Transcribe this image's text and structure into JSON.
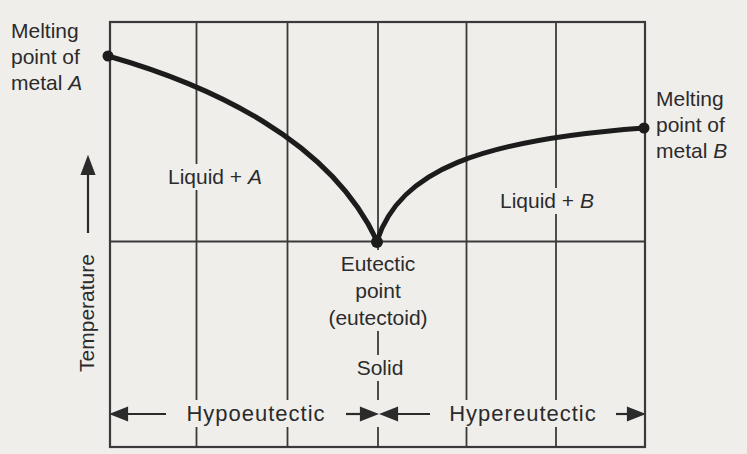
{
  "figure": {
    "kind": "binary eutectic phase diagram (temperature vs. composition, schematic, no numeric scales)",
    "background_color": "#f0eeeb",
    "line_color": "#1c1c1c",
    "grid_color": "#3a3a3a"
  },
  "axis": {
    "y_label": "Temperature",
    "y_arrow": "up"
  },
  "labels": {
    "melting_point_a": {
      "line1": "Melting",
      "line2": "point of",
      "line3": "metal",
      "metal": "A"
    },
    "melting_point_b": {
      "line1": "Melting",
      "line2": "point of",
      "line3": "metal",
      "metal": "B"
    },
    "region_liquid_a": {
      "prefix": "Liquid +",
      "metal": "A"
    },
    "region_liquid_b": {
      "prefix": "Liquid +",
      "metal": "B"
    },
    "eutectic": {
      "line1": "Eutectic",
      "line2": "point",
      "line3": "(eutectoid)"
    },
    "solid": "Solid",
    "hypoeutectic": "Hypoeutectic",
    "hypereutectic": "Hypereutectic"
  },
  "structure": {
    "markers": [
      "melting point of metal A on upper left boundary",
      "melting point of metal B on right boundary",
      "eutectic point at bottom of V where both liquidus curves meet the horizontal eutectic line"
    ],
    "curves": [
      "liquidus from melting point of A descending to eutectic point",
      "liquidus from eutectic point rising to melting point of B"
    ],
    "regions": [
      "Liquid + A (left of eutectic, above eutectic line)",
      "Liquid + B (right of eutectic, above eutectic line)",
      "Solid (below eutectic line)"
    ],
    "composition_bands": [
      "Hypoeutectic (left of eutectic composition)",
      "Hypereutectic (right of eutectic composition)"
    ],
    "gridlines": "5 vertical composition gridlines dividing plot into 6 columns"
  }
}
